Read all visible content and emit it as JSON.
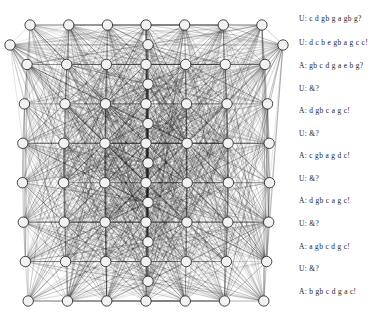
{
  "figure": {
    "graph": {
      "name": "dense-node-link-graph",
      "node_fill": "#f2f2f2",
      "node_stroke": "#1a1a1a",
      "edge_color": "#1a1a1a",
      "background": "#ffffff",
      "node_count": 56,
      "node_radius": 5.2,
      "layout": "trapezoidal-grid",
      "rows": 8,
      "columns": 7
    },
    "dialogue": {
      "name": "dialogue-transcript",
      "speaker_user": "U",
      "speaker_agent": "A",
      "lines": [
        {
          "speaker": "U",
          "text": "U: c d gb g a gb g?",
          "y": 14
        },
        {
          "speaker": "U",
          "text": "U: d c b e gb a g c c!",
          "y": 38
        },
        {
          "speaker": "A",
          "text": "A: gb c d g a e b g?",
          "y": 61
        },
        {
          "speaker": "U",
          "text": "U: &?",
          "y": 84
        },
        {
          "speaker": "A",
          "text": "A: d gb c a g c!",
          "y": 106
        },
        {
          "speaker": "U",
          "text": "U: &?",
          "y": 129
        },
        {
          "speaker": "A",
          "text": "A: c gb a g d c!",
          "y": 151
        },
        {
          "speaker": "U",
          "text": "U: &?",
          "y": 174
        },
        {
          "speaker": "A",
          "text": "A: d gb c a g c!",
          "y": 196
        },
        {
          "speaker": "U",
          "text": "U: &?",
          "y": 219
        },
        {
          "speaker": "A",
          "text": "A: a gb c d g c!",
          "y": 242
        },
        {
          "speaker": "U",
          "text": "U: &?",
          "y": 264
        },
        {
          "speaker": "A",
          "text": "A: b gb c d g a c!",
          "y": 287
        }
      ]
    }
  }
}
